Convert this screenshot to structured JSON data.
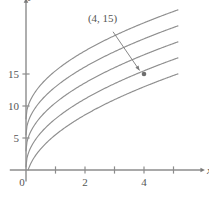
{
  "chart_data": {
    "type": "line",
    "title": "",
    "xlabel": "x",
    "ylabel": "y",
    "xlim": [
      -0.55,
      6.1
    ],
    "ylim": [
      -1.8,
      27.0
    ],
    "grid": false,
    "legend": null,
    "x_ticks": [
      1,
      2,
      3,
      4,
      5
    ],
    "x_tick_labels": [
      "",
      "2",
      "",
      "4",
      ""
    ],
    "x_labeled_ticks": [
      {
        "value": 0,
        "label": "0"
      },
      {
        "value": 2,
        "label": "2"
      },
      {
        "value": 4,
        "label": "4"
      }
    ],
    "y_ticks": [
      5,
      10,
      15
    ],
    "y_tick_labels": [
      "5",
      "10",
      "15"
    ],
    "origin_label": "0",
    "curve_form": "y = a*sqrt(x) + c",
    "series": [
      {
        "name": "curve-1",
        "a": 7.5,
        "c": 8.0,
        "x_start": 0,
        "x_end": 5.15,
        "y_at_0": 8.0,
        "y_at_5": 24.8
      },
      {
        "name": "curve-2",
        "a": 7.5,
        "c": 5.5,
        "x_start": 0,
        "x_end": 5.15,
        "y_at_0": 5.5,
        "y_at_5": 22.3
      },
      {
        "name": "curve-3",
        "a": 7.5,
        "c": 3.0,
        "x_start": 0,
        "x_end": 5.15,
        "y_at_0": 3.0,
        "y_at_5": 19.8
      },
      {
        "name": "curve-4",
        "a": 7.5,
        "c": 0.5,
        "x_start": 0,
        "x_end": 5.15,
        "y_at_0": 0.5,
        "y_at_5": 17.3
      },
      {
        "name": "curve-5",
        "a": 7.5,
        "c": -2.0,
        "x_start": 0.071,
        "x_end": 5.15,
        "y_at_0": 0.0,
        "y_at_5": 14.8
      }
    ],
    "annotations": [
      {
        "name": "point-4-15",
        "label": "(4, 15)",
        "x": 4,
        "y": 15,
        "label_x": 2.1,
        "label_y": 23.2,
        "arrow_from_x": 2.95,
        "arrow_from_y": 21.6,
        "arrow_to_x": 3.85,
        "arrow_to_y": 15.55
      }
    ],
    "colors": {
      "curve": "#8f8f8f",
      "axis": "#8c8c8c",
      "text": "#555555",
      "point": "#6e6e6e",
      "arrow": "#7a7a7a",
      "background": "#ffffff"
    }
  }
}
